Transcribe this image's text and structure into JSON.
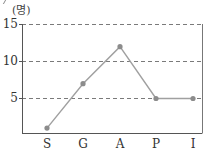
{
  "chart_data": {
    "type": "line",
    "title": "",
    "xlabel": "",
    "ylabel": "(명)",
    "categories": [
      "S",
      "G",
      "A",
      "P",
      "I"
    ],
    "values": [
      1,
      7,
      12,
      5,
      5
    ],
    "yticks": [
      5,
      10,
      15
    ],
    "ytick_labels": [
      "5",
      "10",
      "15"
    ],
    "ylim": [
      0,
      15
    ],
    "grid": {
      "y": true,
      "x": false,
      "style": "dashed"
    },
    "legend": null,
    "colors": {
      "line": "#a0a0a0",
      "marker": "#8c8c8c",
      "axis": "#555555",
      "grid": "#7a7a7a"
    }
  },
  "labels": {
    "unit": "(명)",
    "y15": "15",
    "y10": "10",
    "y5": "5",
    "x0": "S",
    "x1": "G",
    "x2": "A",
    "x3": "P",
    "x4": "I"
  }
}
